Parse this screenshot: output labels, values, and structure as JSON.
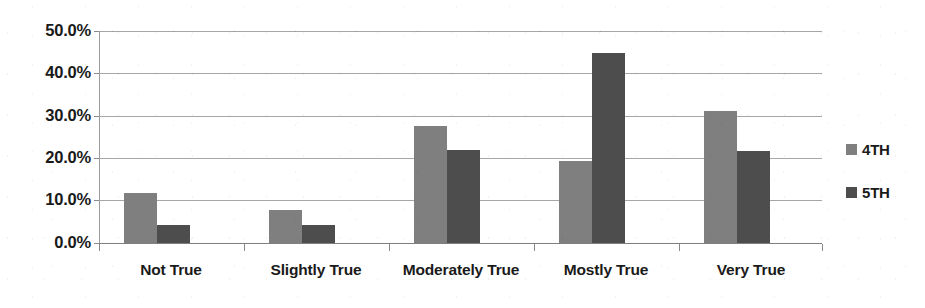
{
  "chart_data": {
    "type": "bar",
    "title": "",
    "xlabel": "",
    "ylabel": "",
    "categories": [
      "Not True",
      "Slightly True",
      "Moderately True",
      "Mostly True",
      "Very True"
    ],
    "series": [
      {
        "name": "4TH",
        "color": "#7f7f7f",
        "values": [
          11.8,
          7.7,
          27.6,
          19.3,
          31.1
        ]
      },
      {
        "name": "5TH",
        "color": "#4d4d4d",
        "values": [
          4.3,
          4.3,
          22.0,
          44.8,
          21.8
        ]
      }
    ],
    "ylim": [
      0,
      50
    ],
    "ytick_values": [
      0,
      10,
      20,
      30,
      40,
      50
    ],
    "ytick_labels": [
      "0.0%",
      "10.0%",
      "20.0%",
      "30.0%",
      "40.0%",
      "50.0%"
    ],
    "grid": true,
    "legend_position": "right",
    "value_suffix": "%"
  },
  "legend": {
    "items": [
      {
        "label": "4TH",
        "color": "#7f7f7f"
      },
      {
        "label": "5TH",
        "color": "#4d4d4d"
      }
    ]
  }
}
